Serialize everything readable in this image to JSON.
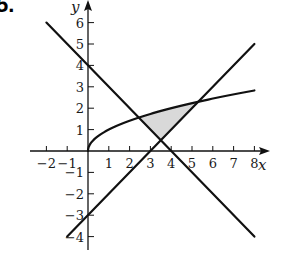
{
  "problem": {
    "label": "5."
  },
  "chart_data": {
    "type": "line",
    "title": "",
    "xlabel": "x",
    "ylabel": "y",
    "xlim": [
      -2,
      8
    ],
    "ylim": [
      -4,
      6
    ],
    "grid": false,
    "x_ticks": [
      -2,
      -1,
      1,
      2,
      3,
      4,
      5,
      6,
      7,
      8
    ],
    "y_ticks": [
      -4,
      -3,
      -2,
      -1,
      1,
      2,
      3,
      4,
      5,
      6
    ],
    "x_tick_labels": [
      "−2",
      "−1",
      "1",
      "2",
      "3",
      "4",
      "5",
      "6",
      "7",
      "8"
    ],
    "y_tick_labels": [
      "−4",
      "−3",
      "−2",
      "−1",
      "1",
      "2",
      "3",
      "4",
      "5",
      "6"
    ],
    "series": [
      {
        "name": "y = 4 − x",
        "kind": "line",
        "x": [
          -2,
          8
        ],
        "y": [
          6,
          -4
        ]
      },
      {
        "name": "y = x − 3",
        "kind": "line",
        "x": [
          -1,
          8
        ],
        "y": [
          -4,
          5
        ]
      },
      {
        "name": "y = √x",
        "kind": "curve",
        "x": [
          0,
          0.25,
          1,
          2,
          3,
          4,
          5,
          6,
          7,
          8
        ],
        "y": [
          0,
          0.5,
          1,
          1.414,
          1.732,
          2,
          2.236,
          2.449,
          2.646,
          2.828
        ]
      }
    ],
    "shaded_region": {
      "description": "Region bounded above by y = √x, on the left by y = 4 − x, and on the right by y = x − 3",
      "vertices": [
        [
          2.438,
          1.562
        ],
        [
          3.5,
          0.5
        ],
        [
          5.303,
          2.303
        ]
      ],
      "fill": "#d9d9d9"
    },
    "intersections": [
      {
        "curves": [
          "y = √x",
          "y = 4 − x"
        ],
        "point": [
          2.438,
          1.562
        ]
      },
      {
        "curves": [
          "y = 4 − x",
          "y = x − 3"
        ],
        "point": [
          3.5,
          0.5
        ]
      },
      {
        "curves": [
          "y = √x",
          "y = x − 3"
        ],
        "point": [
          5.303,
          2.303
        ]
      }
    ]
  },
  "colors": {
    "stroke": "#111111",
    "shade": "#d9d9d9",
    "background": "#ffffff"
  }
}
